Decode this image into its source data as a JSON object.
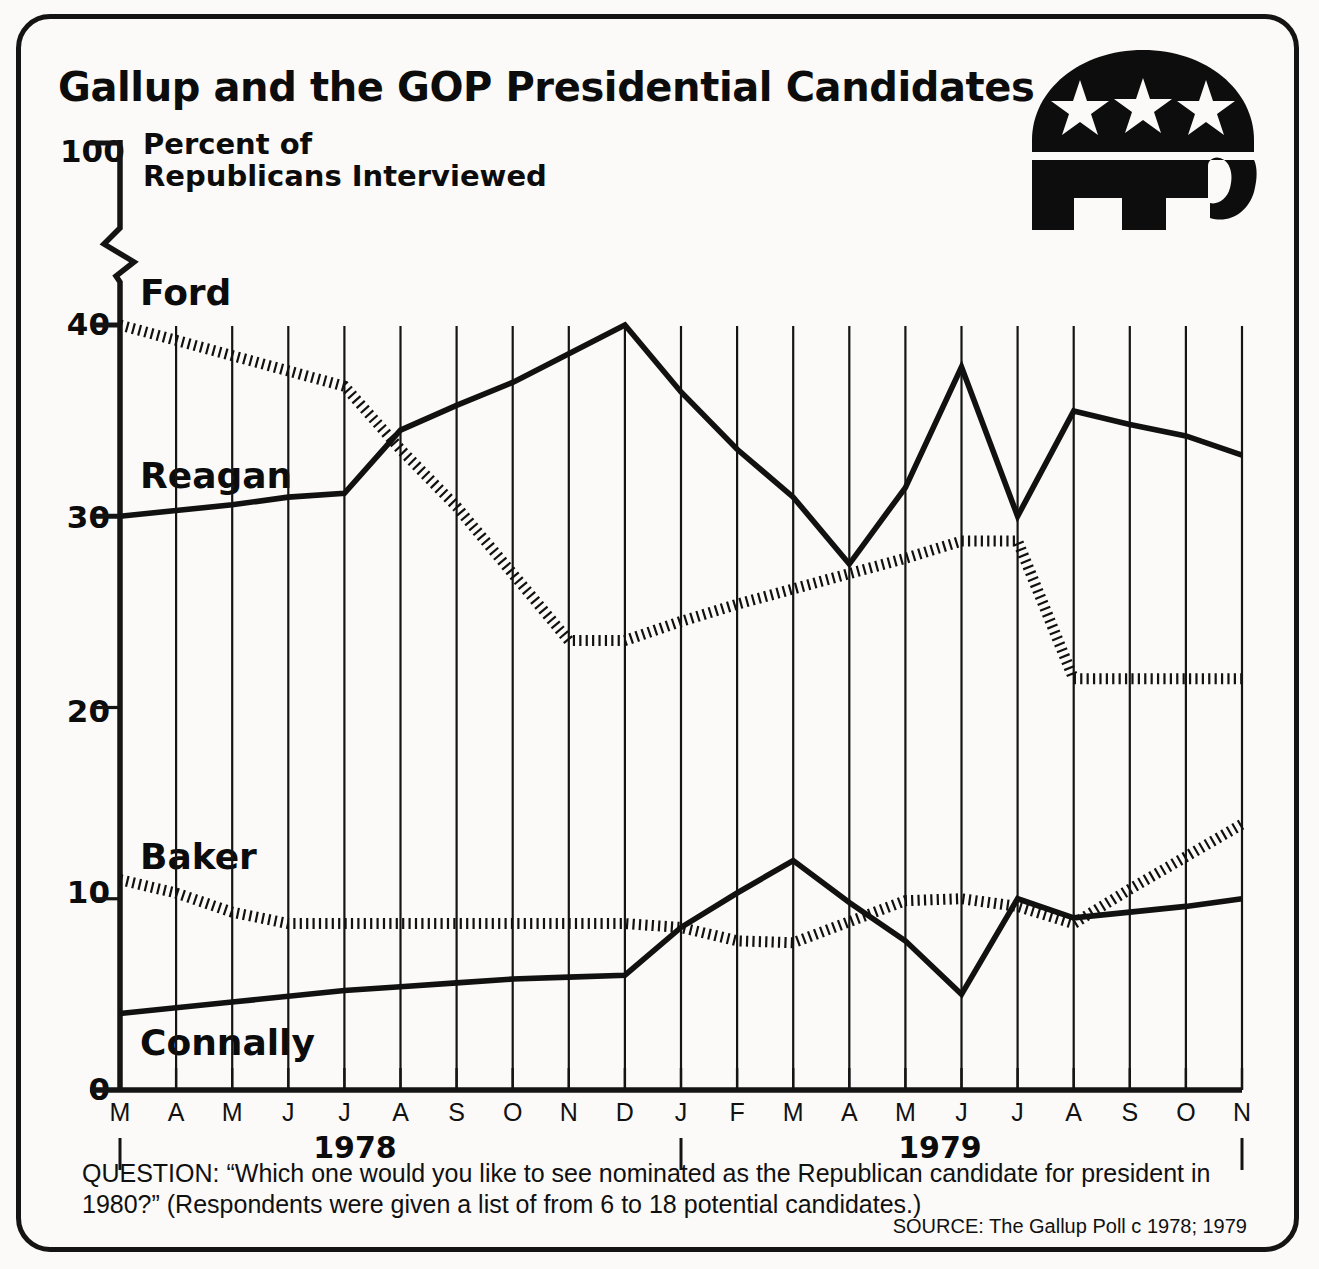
{
  "title": "Gallup and the GOP Presidential Candidates",
  "logo": {
    "name": "gop-elephant-logo",
    "stars": 3,
    "color": "#0d0d0d"
  },
  "axis": {
    "y_top_label": "100",
    "y_axis_title": "Percent of\nRepublicans Interviewed",
    "y_ticks": [
      "40",
      "30",
      "20",
      "10",
      "0"
    ],
    "y_break": true,
    "x_ticks": [
      "M",
      "A",
      "M",
      "J",
      "J",
      "A",
      "S",
      "O",
      "N",
      "D",
      "J",
      "F",
      "M",
      "A",
      "M",
      "J",
      "J",
      "A",
      "S",
      "O",
      "N"
    ],
    "years": [
      "1978",
      "1979"
    ]
  },
  "series_labels": {
    "ford": "Ford",
    "reagan": "Reagan",
    "baker": "Baker",
    "connally": "Connally"
  },
  "caption": "QUESTION: “Which one would you like to see nominated as the Republican candidate for president in 1980?” (Respondents were given a list of from 6 to 18 potential candidates.)",
  "source": "SOURCE: The Gallup Poll c 1978; 1979",
  "chart_data": {
    "type": "line",
    "title": "Gallup and the GOP Presidential Candidates",
    "subtitle": "Percent of Republicans Interviewed",
    "xlabel": "",
    "ylabel": "Percent of Republicans Interviewed",
    "ylim": [
      0,
      100
    ],
    "y_axis_break_between": [
      44,
      96
    ],
    "y_ticks": [
      0,
      10,
      20,
      30,
      40,
      100
    ],
    "grid": "vertical",
    "legend": "inline-labels",
    "x": [
      "M 1978",
      "A 1978",
      "M 1978",
      "J 1978",
      "J 1978",
      "A 1978",
      "S 1978",
      "O 1978",
      "N 1978",
      "D 1978",
      "J 1979",
      "F 1979",
      "M 1979",
      "A 1979",
      "M 1979",
      "J 1979",
      "J 1979",
      "A 1979",
      "S 1979",
      "O 1979",
      "N 1979"
    ],
    "categories": [
      "M",
      "A",
      "M",
      "J",
      "J",
      "A",
      "S",
      "O",
      "N",
      "D",
      "J",
      "F",
      "M",
      "A",
      "M",
      "J",
      "J",
      "A",
      "S",
      "O",
      "N"
    ],
    "series": [
      {
        "name": "Ford",
        "style": "dotted",
        "values": [
          40.0,
          39.2,
          38.4,
          37.6,
          36.8,
          33.5,
          30.5,
          27.0,
          23.5,
          23.5,
          24.5,
          25.4,
          26.2,
          27.0,
          27.8,
          28.7,
          28.7,
          21.5,
          21.5,
          21.5,
          21.5
        ]
      },
      {
        "name": "Reagan",
        "style": "solid",
        "values": [
          30.0,
          30.3,
          30.6,
          31.0,
          31.2,
          34.5,
          35.8,
          37.0,
          38.5,
          40.0,
          36.5,
          33.5,
          31.0,
          27.5,
          31.5,
          37.8,
          30.0,
          35.5,
          34.8,
          34.2,
          33.2
        ]
      },
      {
        "name": "Baker",
        "style": "dotted",
        "values": [
          11.0,
          10.3,
          9.3,
          8.7,
          8.7,
          8.7,
          8.7,
          8.7,
          8.7,
          8.7,
          8.5,
          7.8,
          7.7,
          8.8,
          9.9,
          10.0,
          9.6,
          8.7,
          10.5,
          12.2,
          13.9
        ]
      },
      {
        "name": "Connally",
        "style": "solid",
        "values": [
          4.0,
          4.3,
          4.6,
          4.9,
          5.2,
          5.4,
          5.6,
          5.8,
          5.9,
          6.0,
          8.5,
          10.3,
          12.0,
          9.8,
          7.8,
          5.0,
          10.0,
          9.0,
          9.3,
          9.6,
          10.0
        ]
      }
    ],
    "annotations": [
      {
        "text": "Ford",
        "near_series": "Ford"
      },
      {
        "text": "Reagan",
        "near_series": "Reagan"
      },
      {
        "text": "Baker",
        "near_series": "Baker"
      },
      {
        "text": "Connally",
        "near_series": "Connally"
      }
    ]
  },
  "geometry": {
    "plot_left": 120,
    "plot_right": 1242,
    "plot_top": 268,
    "plot_bottom": 1090,
    "y0_px": 1090,
    "y40_px": 325,
    "px_per_unit": 19.125
  }
}
